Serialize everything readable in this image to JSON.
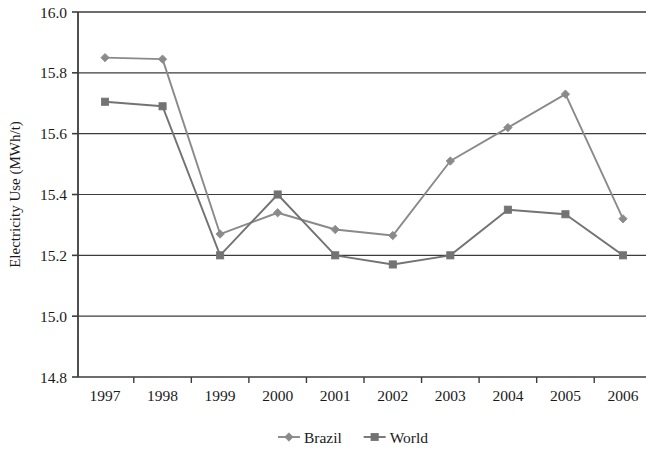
{
  "chart_data": {
    "type": "line",
    "title": "",
    "xlabel": "",
    "ylabel": "Electricity Use (MWh/t)",
    "categories": [
      "1997",
      "1998",
      "1999",
      "2000",
      "2001",
      "2002",
      "2003",
      "2004",
      "2005",
      "2006"
    ],
    "series": [
      {
        "name": "Brazil",
        "marker": "diamond",
        "color": "#8a8a8a",
        "values": [
          15.85,
          15.845,
          15.27,
          15.34,
          15.285,
          15.265,
          15.51,
          15.62,
          15.73,
          15.32
        ]
      },
      {
        "name": "World",
        "marker": "square",
        "color": "#737373",
        "values": [
          15.705,
          15.69,
          15.2,
          15.4,
          15.2,
          15.17,
          15.2,
          15.35,
          15.335,
          15.2
        ]
      }
    ],
    "ylim": [
      14.8,
      16.0
    ],
    "ytick_step": 0.2,
    "yticks": [
      "16.0",
      "15.8",
      "15.6",
      "15.4",
      "15.2",
      "15.0",
      "14.8"
    ],
    "ytick_values": [
      16.0,
      15.8,
      15.6,
      15.4,
      15.2,
      15.0,
      14.8
    ],
    "grid": true,
    "grid_axis": "y",
    "legend_position": "bottom"
  },
  "legend": {
    "entries": [
      {
        "label": "Brazil",
        "marker": "diamond"
      },
      {
        "label": "World",
        "marker": "square"
      }
    ]
  },
  "colors": {
    "brazil": "#8a8a8a",
    "world": "#737373",
    "grid": "#3c3c3c",
    "axis": "#3c3c3c",
    "text": "#1a1a1a",
    "background": "#ffffff"
  }
}
